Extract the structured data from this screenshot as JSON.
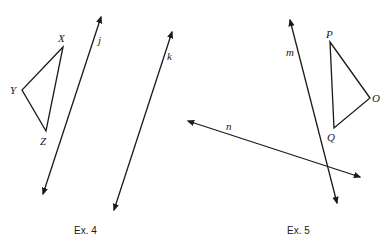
{
  "exercises": [
    {
      "caption": "Ex. 4",
      "triangle": {
        "vertices": [
          "X",
          "Y",
          "Z"
        ]
      },
      "lines": [
        "j",
        "k"
      ]
    },
    {
      "caption": "Ex. 5",
      "triangle": {
        "vertices": [
          "P",
          "O",
          "Q"
        ]
      },
      "lines": [
        "m",
        "n"
      ]
    }
  ],
  "colors": {
    "ink": "#1a1a1a",
    "background": "#ffffff"
  }
}
